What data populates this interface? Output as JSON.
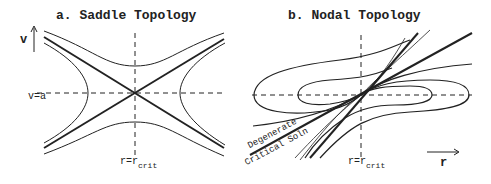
{
  "panel_a": {
    "title": "a. Saddle Topology",
    "y_axis_label": "v",
    "h_line_label": "v=a",
    "v_line_label_main": "r=r",
    "v_line_label_sub": "crit"
  },
  "panel_b": {
    "title": "b. Nodal Topology",
    "x_axis_label": "r",
    "v_line_label_main": "r=r",
    "v_line_label_sub": "crit",
    "annotation_line1": "Degenerate",
    "annotation_line2": "Critical Soln"
  }
}
